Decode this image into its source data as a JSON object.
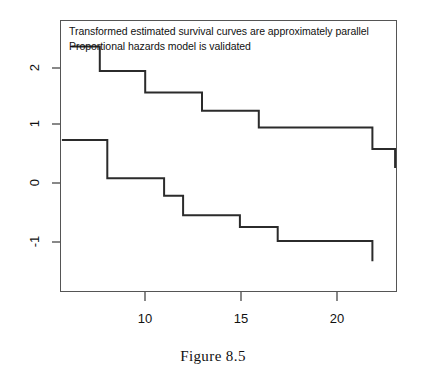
{
  "figure": {
    "caption": "Figure 8.5"
  },
  "annotation": {
    "line1": "Transformed estimated survival curves are approximately parallel",
    "line2": "Proportional hazards model is validated"
  },
  "axes": {
    "x": {
      "ticks": [
        10,
        15,
        20
      ],
      "tick_labels": [
        "10",
        "15",
        "20"
      ],
      "range": [
        5.5,
        23.3
      ],
      "label": ""
    },
    "y": {
      "ticks": [
        -1,
        0,
        1,
        2
      ],
      "tick_labels": [
        "-1",
        "0",
        "1",
        "2"
      ],
      "range": [
        -1.6,
        2.3
      ],
      "label": ""
    }
  },
  "style": {
    "line_color": "#2b2b2b",
    "frame_color": "#555555",
    "background": "#ffffff",
    "line_width": 2.0
  },
  "chart_data": {
    "type": "line",
    "subtype": "step-function",
    "title": "",
    "xlabel": "",
    "ylabel": "",
    "xlim": [
      5.5,
      23.3
    ],
    "ylim": [
      -1.6,
      2.3
    ],
    "grid": false,
    "legend": null,
    "annotations": [
      "Transformed estimated survival curves are approximately parallel",
      "Proportional hazards model is validated"
    ],
    "series": [
      {
        "name": "upper-curve",
        "step": "post",
        "x": [
          6.1,
          7.6,
          7.6,
          10.0,
          10.0,
          13.0,
          13.0,
          16.0,
          16.0,
          22.0,
          22.0,
          23.2,
          23.2
        ],
        "y": [
          1.92,
          1.92,
          1.57,
          1.57,
          1.26,
          1.26,
          1.0,
          1.0,
          0.76,
          0.76,
          0.45,
          0.45,
          0.18
        ]
      },
      {
        "name": "lower-curve",
        "step": "post",
        "x": [
          5.6,
          8.0,
          8.0,
          11.0,
          11.0,
          12.0,
          12.0,
          15.0,
          15.0,
          17.0,
          17.0,
          22.0,
          22.0
        ],
        "y": [
          0.58,
          0.58,
          0.03,
          0.03,
          -0.22,
          -0.22,
          -0.5,
          -0.5,
          -0.67,
          -0.67,
          -0.87,
          -0.87,
          -1.16
        ]
      }
    ]
  }
}
